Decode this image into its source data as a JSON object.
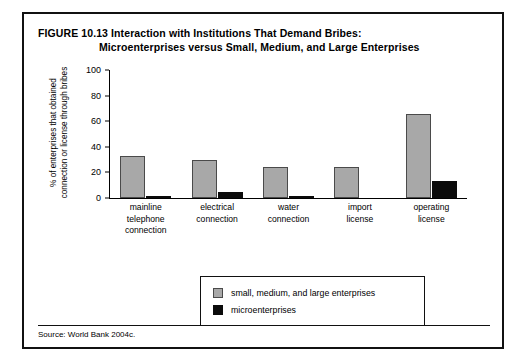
{
  "figure": {
    "number_label": "FIGURE 10.13",
    "title_line1": "Interaction with Institutions That Demand Bribes:",
    "title_line2": "Microenterprises versus Small, Medium, and Large Enterprises",
    "source": "Source: World Bank 2004c."
  },
  "chart_data": {
    "type": "bar",
    "title": "Interaction with Institutions That Demand Bribes: Microenterprises versus Small, Medium, and Large Enterprises",
    "xlabel": "",
    "ylabel_line1": "% of enterprises that obtained",
    "ylabel_line2": "connection or license through bribes",
    "ylim": [
      0,
      100
    ],
    "yticks": [
      0,
      20,
      40,
      60,
      80,
      100
    ],
    "grid": false,
    "legend_position": "bottom-center",
    "categories": [
      "mainline telephone connection",
      "electrical connection",
      "water connection",
      "import license",
      "operating license"
    ],
    "category_lines": [
      [
        "mainline",
        "telephone",
        "connection"
      ],
      [
        "electrical",
        "connection"
      ],
      [
        "water",
        "connection"
      ],
      [
        "import",
        "license"
      ],
      [
        "operating",
        "license"
      ]
    ],
    "series": [
      {
        "name": "small, medium, and large enterprises",
        "color": "#a8a8a8",
        "values": [
          33,
          29.5,
          24,
          24,
          65.5
        ]
      },
      {
        "name": "microenterprises",
        "color": "#0b0b0b",
        "values": [
          1.5,
          4.5,
          1.5,
          0,
          13
        ]
      }
    ]
  }
}
